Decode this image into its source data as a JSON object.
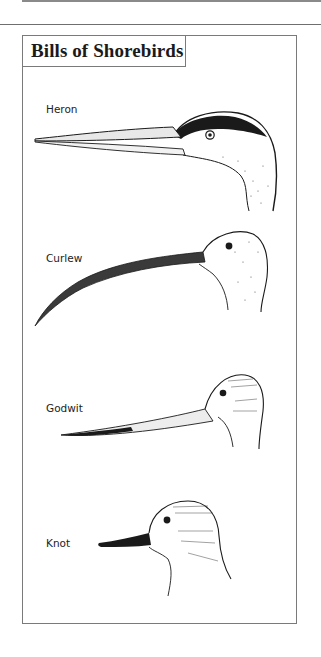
{
  "page": {
    "title": "Bills of Shorebirds"
  },
  "birds": [
    {
      "name": "Heron",
      "bill": "long straight dagger"
    },
    {
      "name": "Curlew",
      "bill": "long downcurved"
    },
    {
      "name": "Godwit",
      "bill": "long slightly upturned"
    },
    {
      "name": "Knot",
      "bill": "short straight"
    }
  ],
  "colors": {
    "ink": "#1a1a1a",
    "border": "#7a7a7a",
    "background": "#ffffff"
  }
}
